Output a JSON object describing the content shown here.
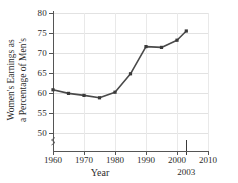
{
  "chart_data": {
    "type": "line",
    "title": "",
    "xlabel": "Year",
    "ylabel_line1": "Women's Earnings as",
    "ylabel_line2": "a Percentage of Men's",
    "xlim": [
      1960,
      2010
    ],
    "ylim": [
      47,
      80
    ],
    "ytick_start": 50,
    "ytick_end": 80,
    "grid": true,
    "legend": "none",
    "xticks": [
      {
        "value": 1960,
        "label": "1960"
      },
      {
        "value": 1970,
        "label": "1970"
      },
      {
        "value": 1980,
        "label": "1980"
      },
      {
        "value": 1990,
        "label": "1990"
      },
      {
        "value": 2000,
        "label": "2000"
      },
      {
        "value": 2010,
        "label": "2010"
      }
    ],
    "highlight_tick": {
      "value": 2003,
      "label": "2003"
    },
    "yticks": [
      {
        "value": 50,
        "label": "50"
      },
      {
        "value": 55,
        "label": "55"
      },
      {
        "value": 60,
        "label": "60"
      },
      {
        "value": 65,
        "label": "65"
      },
      {
        "value": 70,
        "label": "70"
      },
      {
        "value": 75,
        "label": "75"
      },
      {
        "value": 80,
        "label": "80"
      }
    ],
    "x": [
      1960,
      1965,
      1970,
      1975,
      1980,
      1985,
      1990,
      1995,
      2000,
      2003
    ],
    "values": [
      60.8,
      59.9,
      59.4,
      58.8,
      60.2,
      64.8,
      71.6,
      71.4,
      73.2,
      75.5
    ],
    "series": [
      {
        "name": "Women's earnings as a percentage of men's",
        "color": "#4a4a4a",
        "marker": "square",
        "values": [
          60.8,
          59.9,
          59.4,
          58.8,
          60.2,
          64.8,
          71.6,
          71.4,
          73.2,
          75.5
        ]
      }
    ],
    "colors": {
      "line": "#4a4a4a",
      "marker": "#3a3a3a",
      "axis": "#555555",
      "grid": "#e2e2e2",
      "text": "#2b2b2b",
      "background": "#ffffff"
    }
  }
}
